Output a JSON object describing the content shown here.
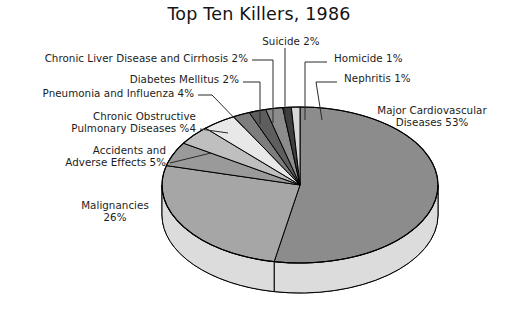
{
  "chart_data": {
    "type": "pie",
    "title": "Top Ten Killers, 1986",
    "xlabel": "",
    "ylabel": "",
    "three_d": true,
    "legend": "labels-with-leader-lines",
    "grid": false,
    "categories": [
      "Major Cardiovascular Diseases",
      "Malignancies",
      "Accidents and Adverse Effects",
      "Chronic Obstructive Pulmonary Diseases",
      "Pneumonia and Influenza",
      "Diabetes Mellitus",
      "Chronic Liver Disease and Cirrhosis",
      "Suicide",
      "Homicide",
      "Nephritis"
    ],
    "values": [
      53,
      26,
      5,
      4,
      4,
      2,
      2,
      2,
      1,
      1
    ],
    "slice_colors": [
      "#8c8c8c",
      "#a6a6a6",
      "#9a9a9a",
      "#bfbfbf",
      "#e8e8e8",
      "#7d7d7d",
      "#5e5e5e",
      "#8c8c8c",
      "#3f3f3f",
      "#d8d8d8"
    ],
    "slices": [
      {
        "label": "Major Cardiovascular Diseases",
        "value": 53,
        "display": "53%"
      },
      {
        "label": "Malignancies",
        "value": 26,
        "display": "26%"
      },
      {
        "label": "Accidents and Adverse Effects",
        "value": 5,
        "display": "5%"
      },
      {
        "label": "Chronic Obstructive Pulmonary Diseases",
        "value": 4,
        "display": "%4"
      },
      {
        "label": "Pneumonia and Influenza",
        "value": 4,
        "display": "4%"
      },
      {
        "label": "Diabetes Mellitus",
        "value": 2,
        "display": "2%"
      },
      {
        "label": "Chronic Liver Disease and Cirrhosis",
        "value": 2,
        "display": "2%"
      },
      {
        "label": "Suicide",
        "value": 2,
        "display": "2%"
      },
      {
        "label": "Homicide",
        "value": 1,
        "display": "1%"
      },
      {
        "label": "Nephritis",
        "value": 1,
        "display": "1%"
      }
    ]
  },
  "labels": {
    "suicide": "Suicide  2%",
    "chronic_liver": "Chronic Liver Disease and Cirrhosis  2%",
    "homicide": "Homicide  1%",
    "diabetes": "Diabetes Mellitus  2%",
    "nephritis": "Nephritis  1%",
    "pneumonia": "Pneumonia and Influenza 4%",
    "copd_line1": "Chronic Obstructive",
    "copd_line2": "Pulmonary Diseases %4",
    "cardio_line1": "Major Cardiovascular",
    "cardio_line2": "Diseases 53%",
    "accidents_line1": "Accidents and",
    "accidents_line2": "Adverse Effects 5%",
    "malignancies_line1": "Malignancies",
    "malignancies_line2": "26%"
  },
  "colors": {
    "background": "#ffffff",
    "text": "#1c1c1c",
    "outline": "#000000",
    "side_wall": "#dcdcdc",
    "side_wall_shadow": "#d0d0d0"
  }
}
